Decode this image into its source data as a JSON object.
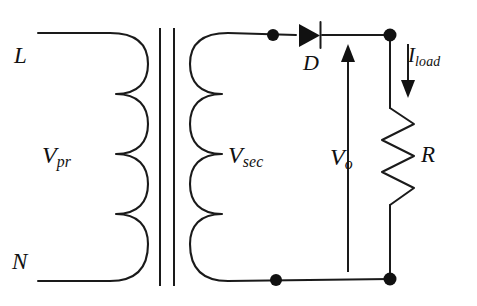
{
  "diagram": {
    "type": "schematic",
    "background_color": "#ffffff",
    "line_color": "#1a1a1a"
  },
  "labels": {
    "line_terminal": "L",
    "neutral_terminal": "N",
    "primary_voltage": "V",
    "primary_voltage_sub": "pr",
    "secondary_voltage": "V",
    "secondary_voltage_sub": "sec",
    "diode": "D",
    "output_voltage": "V",
    "output_voltage_sub": "o",
    "resistor": "R",
    "load_current": "I",
    "load_current_sub": "load"
  },
  "components": {
    "transformer": {
      "name": "transformer",
      "primary_turns": 4,
      "secondary_turns": 4,
      "core_lines": 2
    },
    "diode": {
      "name": "diode",
      "orientation": "anode-left-cathode-right"
    },
    "resistor": {
      "name": "load-resistor",
      "style": "zigzag",
      "zigzag_peaks": 3
    },
    "nodes": [
      {
        "name": "top-left-node",
        "x": 273,
        "y": 36
      },
      {
        "name": "top-right-node",
        "x": 390,
        "y": 35
      },
      {
        "name": "bottom-left-node",
        "x": 276,
        "y": 279
      },
      {
        "name": "bottom-right-node",
        "x": 390,
        "y": 279
      }
    ],
    "arrows": [
      {
        "name": "output-voltage-arrow",
        "direction": "up"
      },
      {
        "name": "load-current-arrow",
        "direction": "down"
      }
    ]
  }
}
